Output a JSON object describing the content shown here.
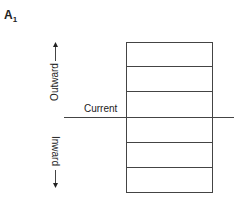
{
  "panel": {
    "label": "A",
    "subscript": "1"
  },
  "labels": {
    "outward": "Outward",
    "inward": "Inward",
    "current": "Current"
  },
  "diagram": {
    "box": {
      "x": 126,
      "y": 42,
      "width": 86,
      "height": 150
    },
    "divider_y": [
      66,
      91,
      142,
      167
    ],
    "current_line": {
      "x1": 64,
      "x2": 234,
      "y": 117
    },
    "outward_arrow": {
      "x": 55,
      "y_from": 60,
      "y_to": 43
    },
    "inward_arrow": {
      "x": 55,
      "y_from": 170,
      "y_to": 187
    },
    "stroke_color": "#444444"
  }
}
